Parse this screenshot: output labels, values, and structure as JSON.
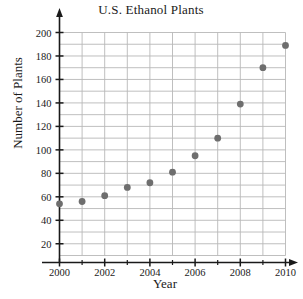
{
  "chart_data": {
    "type": "scatter",
    "title": "U.S. Ethanol Plants",
    "xlabel": "Year",
    "ylabel": "Number of Plants",
    "x": [
      2000,
      2001,
      2002,
      2003,
      2004,
      2005,
      2006,
      2007,
      2008,
      2009,
      2010
    ],
    "values": [
      54,
      56,
      61,
      68,
      72,
      81,
      95,
      110,
      139,
      170,
      189
    ],
    "xlim": [
      2000,
      2010
    ],
    "ylim": [
      0,
      205
    ],
    "x_tick_labels": [
      "2000",
      "2002",
      "2004",
      "2006",
      "2008",
      "2010"
    ],
    "x_tick_values": [
      2000,
      2002,
      2004,
      2006,
      2008,
      2010
    ],
    "x_minor_tick_values": [
      2001,
      2003,
      2005,
      2007,
      2009
    ],
    "y_tick_labels": [
      "20",
      "40",
      "60",
      "80",
      "100",
      "120",
      "140",
      "160",
      "180",
      "200"
    ],
    "y_tick_values": [
      20,
      40,
      60,
      80,
      100,
      120,
      140,
      160,
      180,
      200
    ],
    "y_gridline_values": [
      10,
      20,
      30,
      40,
      50,
      60,
      70,
      80,
      90,
      100,
      110,
      120,
      130,
      140,
      150,
      160,
      170,
      180,
      190,
      200
    ],
    "x_gridline_values": [
      2000,
      2001,
      2002,
      2003,
      2004,
      2005,
      2006,
      2007,
      2008,
      2009,
      2010
    ],
    "grid": true,
    "legend": "none",
    "marker_color": "#6e6e6e",
    "grid_color": "#b8b8b8",
    "axis_color": "#1a1a1a",
    "marker_radius": 3.4
  }
}
